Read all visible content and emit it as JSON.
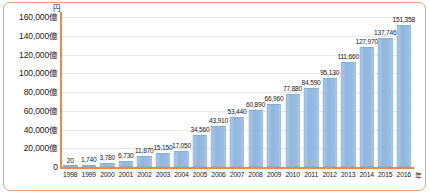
{
  "chart_data": {
    "type": "bar",
    "title": "",
    "xlabel": "年",
    "ylabel": "円",
    "ylim": [
      0,
      160000
    ],
    "grid": true,
    "legend": "none",
    "value_suffix": "",
    "categories": [
      "1998",
      "1999",
      "2000",
      "2001",
      "2002",
      "2003",
      "2004",
      "2005",
      "2006",
      "2007",
      "2008",
      "2009",
      "2010",
      "2011",
      "2012",
      "2013",
      "2014",
      "2015",
      "2016"
    ],
    "values": [
      20,
      1740,
      3780,
      6730,
      11870,
      15150,
      17050,
      34560,
      43910,
      53440,
      60890,
      66960,
      77880,
      84590,
      95130,
      111660,
      127970,
      137746,
      151358
    ],
    "value_labels": [
      "20",
      "1,740",
      "3,780",
      "6,730",
      "11,870",
      "15,150",
      "17,050",
      "34,560",
      "43,910",
      "53,440",
      "60,890",
      "66,960",
      "77,880",
      "84,590",
      "95,130",
      "111,660",
      "127,970",
      "137,746",
      "151,358"
    ],
    "ytick_values": [
      0,
      20000,
      40000,
      60000,
      80000,
      100000,
      120000,
      140000,
      160000
    ],
    "ytick_labels": [
      "0",
      "20,000億",
      "40,000億",
      "60,000億",
      "80,000億",
      "100,000億",
      "120,000億",
      "140,000億",
      "160,000億"
    ],
    "colors": {
      "bar": "#8fb6dd",
      "bar_border": "#86aed6",
      "axis": "#ef8b3c",
      "frame": "#f0a070",
      "gridline": "#e8e8e8",
      "text": "#1a1a1a",
      "background": "#ffffff"
    }
  }
}
